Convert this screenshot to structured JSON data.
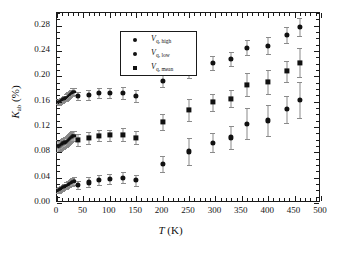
{
  "chart_data": {
    "type": "scatter",
    "title": "",
    "xlabel": "T (K)",
    "ylabel": "K_ab (%)",
    "xlabel_parts": {
      "italic": "T",
      "rest": " (K)"
    },
    "ylabel_parts": {
      "italic": "K",
      "sub": "ab",
      "rest": " (%)"
    },
    "xlim": [
      0,
      500
    ],
    "ylim": [
      0.0,
      0.3
    ],
    "xticks": [
      0,
      50,
      100,
      150,
      200,
      250,
      300,
      350,
      400,
      450,
      500
    ],
    "xtick_labels": [
      "0",
      "50",
      "100",
      "150",
      "200",
      "250",
      "300",
      "350",
      "400",
      "450",
      "500"
    ],
    "yticks": [
      0.0,
      0.04,
      0.08,
      0.12,
      0.16,
      0.2,
      0.24,
      0.28
    ],
    "ytick_labels": [
      "0.00",
      "0.04",
      "0.08",
      "0.12",
      "0.16",
      "0.20",
      "0.24",
      "0.28"
    ],
    "x_minor_interval": 10,
    "y_minor_interval": 0.01,
    "grid": false,
    "legend_position": "upper left",
    "series": [
      {
        "name": "V_q, high",
        "label_italic": "V",
        "label_sub": "q, high",
        "marker": "circle",
        "color": "#111111",
        "points": [
          {
            "x": 2,
            "y": 0.1605,
            "err": 0.004
          },
          {
            "x": 4,
            "y": 0.159,
            "err": 0.004
          },
          {
            "x": 6,
            "y": 0.16,
            "err": 0.004
          },
          {
            "x": 8,
            "y": 0.1615,
            "err": 0.004
          },
          {
            "x": 10,
            "y": 0.1625,
            "err": 0.004
          },
          {
            "x": 12,
            "y": 0.1635,
            "err": 0.004
          },
          {
            "x": 14,
            "y": 0.1645,
            "err": 0.004
          },
          {
            "x": 16,
            "y": 0.1655,
            "err": 0.004
          },
          {
            "x": 18,
            "y": 0.1665,
            "err": 0.005
          },
          {
            "x": 20,
            "y": 0.168,
            "err": 0.005
          },
          {
            "x": 22,
            "y": 0.1695,
            "err": 0.005
          },
          {
            "x": 24,
            "y": 0.171,
            "err": 0.005
          },
          {
            "x": 26,
            "y": 0.1725,
            "err": 0.005
          },
          {
            "x": 28,
            "y": 0.174,
            "err": 0.005
          },
          {
            "x": 30,
            "y": 0.175,
            "err": 0.006
          },
          {
            "x": 33,
            "y": 0.176,
            "err": 0.006
          },
          {
            "x": 40,
            "y": 0.169,
            "err": 0.007
          },
          {
            "x": 60,
            "y": 0.171,
            "err": 0.008
          },
          {
            "x": 80,
            "y": 0.174,
            "err": 0.008
          },
          {
            "x": 100,
            "y": 0.174,
            "err": 0.008
          },
          {
            "x": 125,
            "y": 0.1735,
            "err": 0.009
          },
          {
            "x": 150,
            "y": 0.169,
            "err": 0.009
          },
          {
            "x": 200,
            "y": 0.1925,
            "err": 0.01
          },
          {
            "x": 250,
            "y": 0.21,
            "err": 0.012
          },
          {
            "x": 295,
            "y": 0.221,
            "err": 0.011
          },
          {
            "x": 330,
            "y": 0.227,
            "err": 0.011
          },
          {
            "x": 360,
            "y": 0.2455,
            "err": 0.012
          },
          {
            "x": 400,
            "y": 0.2485,
            "err": 0.013
          },
          {
            "x": 435,
            "y": 0.265,
            "err": 0.013
          },
          {
            "x": 460,
            "y": 0.278,
            "err": 0.014
          }
        ]
      },
      {
        "name": "V_q, low",
        "label_italic": "V",
        "label_sub": "q, low",
        "marker": "circle",
        "color": "#111111",
        "points": [
          {
            "x": 2,
            "y": 0.0195,
            "err": 0.004
          },
          {
            "x": 4,
            "y": 0.0205,
            "err": 0.004
          },
          {
            "x": 6,
            "y": 0.0215,
            "err": 0.004
          },
          {
            "x": 8,
            "y": 0.0225,
            "err": 0.004
          },
          {
            "x": 10,
            "y": 0.0235,
            "err": 0.004
          },
          {
            "x": 12,
            "y": 0.0245,
            "err": 0.004
          },
          {
            "x": 14,
            "y": 0.0255,
            "err": 0.004
          },
          {
            "x": 16,
            "y": 0.0265,
            "err": 0.004
          },
          {
            "x": 18,
            "y": 0.0275,
            "err": 0.005
          },
          {
            "x": 20,
            "y": 0.0285,
            "err": 0.005
          },
          {
            "x": 22,
            "y": 0.0295,
            "err": 0.005
          },
          {
            "x": 24,
            "y": 0.0305,
            "err": 0.005
          },
          {
            "x": 26,
            "y": 0.0315,
            "err": 0.005
          },
          {
            "x": 28,
            "y": 0.0325,
            "err": 0.005
          },
          {
            "x": 30,
            "y": 0.0335,
            "err": 0.006
          },
          {
            "x": 33,
            "y": 0.0345,
            "err": 0.006
          },
          {
            "x": 40,
            "y": 0.0285,
            "err": 0.007
          },
          {
            "x": 60,
            "y": 0.0325,
            "err": 0.008
          },
          {
            "x": 80,
            "y": 0.037,
            "err": 0.008
          },
          {
            "x": 100,
            "y": 0.0385,
            "err": 0.008
          },
          {
            "x": 125,
            "y": 0.04,
            "err": 0.009
          },
          {
            "x": 150,
            "y": 0.036,
            "err": 0.009
          },
          {
            "x": 200,
            "y": 0.0615,
            "err": 0.012
          },
          {
            "x": 250,
            "y": 0.0815,
            "err": 0.021
          },
          {
            "x": 295,
            "y": 0.0955,
            "err": 0.015
          },
          {
            "x": 330,
            "y": 0.1035,
            "err": 0.018
          },
          {
            "x": 360,
            "y": 0.1255,
            "err": 0.024
          },
          {
            "x": 400,
            "y": 0.1305,
            "err": 0.025
          },
          {
            "x": 435,
            "y": 0.148,
            "err": 0.021
          },
          {
            "x": 460,
            "y": 0.1625,
            "err": 0.029
          }
        ]
      },
      {
        "name": "V_q, mean",
        "label_italic": "V",
        "label_sub": "q, mean",
        "marker": "square",
        "color": "#111111",
        "points": [
          {
            "x": 2,
            "y": 0.09,
            "err": 0.009
          },
          {
            "x": 4,
            "y": 0.0895,
            "err": 0.009
          },
          {
            "x": 6,
            "y": 0.0905,
            "err": 0.009
          },
          {
            "x": 8,
            "y": 0.092,
            "err": 0.008
          },
          {
            "x": 10,
            "y": 0.093,
            "err": 0.008
          },
          {
            "x": 12,
            "y": 0.094,
            "err": 0.008
          },
          {
            "x": 14,
            "y": 0.095,
            "err": 0.008
          },
          {
            "x": 16,
            "y": 0.096,
            "err": 0.008
          },
          {
            "x": 18,
            "y": 0.097,
            "err": 0.008
          },
          {
            "x": 20,
            "y": 0.0985,
            "err": 0.008
          },
          {
            "x": 22,
            "y": 0.1,
            "err": 0.008
          },
          {
            "x": 24,
            "y": 0.1015,
            "err": 0.008
          },
          {
            "x": 26,
            "y": 0.103,
            "err": 0.008
          },
          {
            "x": 28,
            "y": 0.1045,
            "err": 0.008
          },
          {
            "x": 30,
            "y": 0.1055,
            "err": 0.008
          },
          {
            "x": 33,
            "y": 0.106,
            "err": 0.008
          },
          {
            "x": 40,
            "y": 0.0995,
            "err": 0.009
          },
          {
            "x": 60,
            "y": 0.1025,
            "err": 0.009
          },
          {
            "x": 80,
            "y": 0.1065,
            "err": 0.009
          },
          {
            "x": 100,
            "y": 0.107,
            "err": 0.009
          },
          {
            "x": 125,
            "y": 0.108,
            "err": 0.01
          },
          {
            "x": 150,
            "y": 0.103,
            "err": 0.01
          },
          {
            "x": 200,
            "y": 0.1275,
            "err": 0.013
          },
          {
            "x": 250,
            "y": 0.1465,
            "err": 0.017
          },
          {
            "x": 295,
            "y": 0.159,
            "err": 0.013
          },
          {
            "x": 330,
            "y": 0.165,
            "err": 0.014
          },
          {
            "x": 360,
            "y": 0.187,
            "err": 0.018
          },
          {
            "x": 400,
            "y": 0.191,
            "err": 0.019
          },
          {
            "x": 435,
            "y": 0.208,
            "err": 0.017
          },
          {
            "x": 460,
            "y": 0.2215,
            "err": 0.023
          }
        ]
      }
    ]
  }
}
